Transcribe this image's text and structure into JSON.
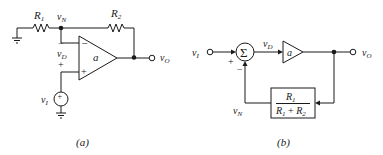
{
  "figure_a": {
    "caption": "(a)",
    "r1_label": "R",
    "r1_sub": "1",
    "r2_label": "R",
    "r2_sub": "2",
    "vn_label": "v",
    "vn_sub": "N",
    "vd_label": "v",
    "vd_sub": "D",
    "vd_minus": "−",
    "vd_plus": "+",
    "opamp_gain": "a",
    "opamp_minus": "−",
    "opamp_plus": "+",
    "source_label": "v",
    "source_sub": "I",
    "source_sign": "+",
    "vo_label": "v",
    "vo_sub": "O"
  },
  "figure_b": {
    "caption": "(b)",
    "vi_label": "v",
    "vi_sub": "I",
    "sum_symbol": "Σ",
    "sum_plus": "+",
    "sum_minus": "−",
    "vd_label": "v",
    "vd_sub": "D",
    "amp_gain": "a",
    "vo_label": "v",
    "vo_sub": "O",
    "vn_label": "v",
    "vn_sub": "N",
    "feedback_numerator": "R",
    "feedback_numerator_sub": "1",
    "feedback_denominator_a": "R",
    "feedback_denominator_a_sub": "1",
    "feedback_plus": " + ",
    "feedback_denominator_b": "R",
    "feedback_denominator_b_sub": "2"
  }
}
